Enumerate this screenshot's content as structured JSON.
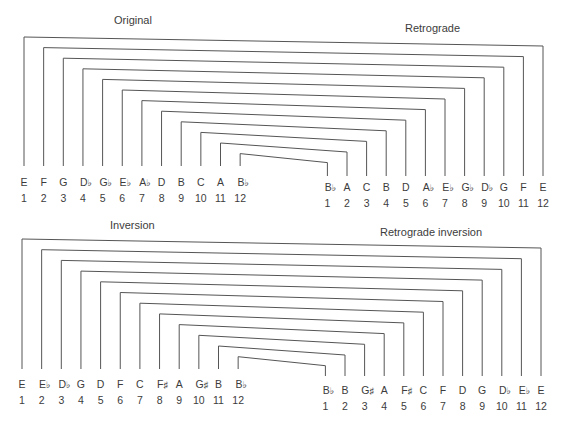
{
  "diagrams": [
    {
      "name": "top",
      "left_title": "Original",
      "right_title": "Retrograde",
      "left_row": {
        "notes": [
          "E",
          "F",
          "G",
          "D♭",
          "G♭",
          "E♭",
          "A♭",
          "D",
          "B",
          "C",
          "A",
          "B♭"
        ],
        "numbers": [
          "1",
          "2",
          "3",
          "4",
          "5",
          "6",
          "7",
          "8",
          "9",
          "10",
          "11",
          "12"
        ]
      },
      "right_row": {
        "notes": [
          "B♭",
          "A",
          "C",
          "B",
          "D",
          "A♭",
          "E♭",
          "G♭",
          "D♭",
          "G",
          "F",
          "E"
        ],
        "numbers": [
          "1",
          "2",
          "3",
          "4",
          "5",
          "6",
          "7",
          "8",
          "9",
          "10",
          "11",
          "12"
        ]
      }
    },
    {
      "name": "bottom",
      "left_title": "Inversion",
      "right_title": "Retrograde inversion",
      "left_row": {
        "notes": [
          "E",
          "E♭",
          "D♭",
          "G",
          "D",
          "F",
          "C",
          "F♯",
          "A",
          "G♯",
          "B",
          "B♭"
        ],
        "numbers": [
          "1",
          "2",
          "3",
          "4",
          "5",
          "6",
          "7",
          "8",
          "9",
          "10",
          "11",
          "12"
        ]
      },
      "right_row": {
        "notes": [
          "B♭",
          "B",
          "G♯",
          "A",
          "F♯",
          "C",
          "F",
          "D",
          "G",
          "D♭",
          "E♭",
          "E"
        ],
        "numbers": [
          "1",
          "2",
          "3",
          "4",
          "5",
          "6",
          "7",
          "8",
          "9",
          "10",
          "11",
          "12"
        ]
      }
    }
  ],
  "colors": {
    "line": "#555555",
    "text": "#3c3c3c"
  }
}
